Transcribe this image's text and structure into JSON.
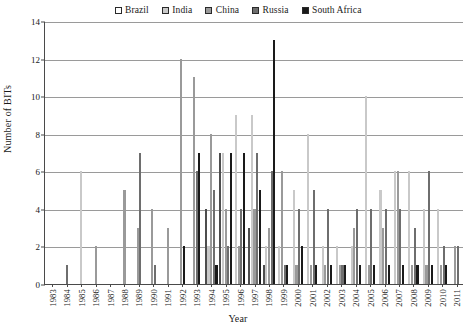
{
  "chart_data": {
    "type": "bar",
    "title": "",
    "xlabel": "Year",
    "ylabel": "Number of BITs",
    "ylim": [
      0,
      14
    ],
    "ytick_step": 2,
    "yticks": [
      0,
      2,
      4,
      6,
      8,
      10,
      12,
      14
    ],
    "grid": true,
    "legend_position": "top-center",
    "categories": [
      "1983",
      "1984",
      "1985",
      "1986",
      "1987",
      "1988",
      "1989",
      "1990",
      "1991",
      "1992",
      "1993",
      "1994",
      "1995",
      "1996",
      "1997",
      "1998",
      "1999",
      "2000",
      "2001",
      "2002",
      "2003",
      "2004",
      "2005",
      "2006",
      "2007",
      "2008",
      "2009",
      "2010",
      "2011"
    ],
    "series": [
      {
        "name": "Brazil",
        "color": "#ffffff",
        "values": [
          0,
          0,
          0,
          0,
          0,
          0,
          0,
          0,
          0,
          0,
          0,
          4,
          7,
          0,
          3,
          1,
          0,
          0,
          0,
          0,
          0,
          0,
          0,
          0,
          0,
          0,
          0,
          0,
          0
        ]
      },
      {
        "name": "India",
        "color": "#c9c9c9",
        "values": [
          0,
          0,
          6,
          0,
          0,
          0,
          0,
          0,
          0,
          0,
          0,
          2,
          7,
          9,
          9,
          2,
          2,
          5,
          8,
          2,
          2,
          2,
          10,
          5,
          6,
          6,
          4,
          4,
          0
        ]
      },
      {
        "name": "China",
        "color": "#9a9a9a",
        "values": [
          0,
          0,
          0,
          2,
          0,
          5,
          3,
          4,
          3,
          12,
          11,
          8,
          4,
          2,
          4,
          3,
          6,
          1,
          1,
          1,
          1,
          3,
          1,
          3,
          6,
          1,
          1,
          1,
          2
        ]
      },
      {
        "name": "Russia",
        "color": "#6e6e6e",
        "values": [
          0,
          1,
          0,
          0,
          0,
          0,
          7,
          1,
          0,
          0,
          6,
          5,
          2,
          4,
          7,
          6,
          1,
          4,
          5,
          4,
          1,
          4,
          4,
          4,
          4,
          3,
          6,
          2,
          2
        ]
      },
      {
        "name": "South Africa",
        "color": "#1a1a1a",
        "values": [
          0,
          0,
          0,
          0,
          0,
          0,
          0,
          0,
          0,
          2,
          7,
          1,
          7,
          7,
          5,
          13,
          1,
          2,
          1,
          1,
          1,
          1,
          1,
          1,
          1,
          1,
          1,
          1,
          0
        ]
      }
    ]
  },
  "legend": {
    "entries": [
      {
        "label": "Brazil",
        "swatch": "#ffffff"
      },
      {
        "label": "India",
        "swatch": "#c9c9c9"
      },
      {
        "label": "China",
        "swatch": "#9a9a9a"
      },
      {
        "label": "Russia",
        "swatch": "#6e6e6e"
      },
      {
        "label": "South Africa",
        "swatch": "#1a1a1a"
      }
    ]
  }
}
